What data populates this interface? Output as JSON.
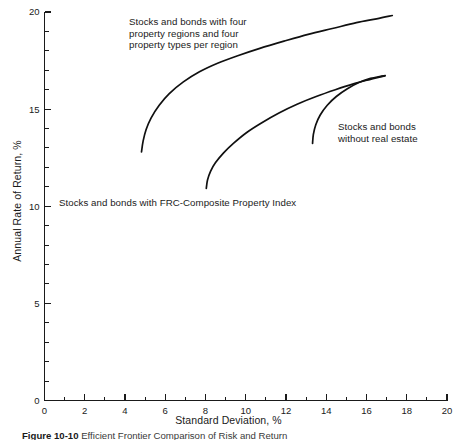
{
  "chart_data": {
    "type": "line",
    "title": "",
    "xlabel": "Standard Deviation, %",
    "ylabel": "Annual Rate of Return, %",
    "xlim": [
      0,
      20
    ],
    "ylim": [
      0,
      20
    ],
    "grid": false,
    "legend_position": "inline-annotations",
    "x_ticks_major": [
      0,
      2,
      4,
      6,
      8,
      10,
      12,
      14,
      16,
      18,
      20
    ],
    "x_ticks_minor": [
      1,
      3,
      5,
      7,
      9,
      11,
      13,
      15,
      17,
      19
    ],
    "y_ticks_major": [
      0,
      5,
      10,
      15,
      20
    ],
    "y_ticks_minor": [
      1,
      2,
      3,
      4,
      6,
      7,
      8,
      9,
      11,
      12,
      13,
      14,
      16,
      17,
      18,
      19
    ],
    "x_tick_labels": [
      "0",
      "2",
      "4",
      "6",
      "8",
      "10",
      "12",
      "14",
      "16",
      "18",
      "20"
    ],
    "y_tick_labels": [
      "0",
      "5",
      "10",
      "15",
      "20"
    ],
    "series": [
      {
        "name": "Stocks and bonds with four property regions and four property types per region",
        "color": "#101010",
        "x": [
          4.82,
          4.9,
          5.05,
          5.3,
          5.7,
          6.2,
          6.9,
          7.7,
          8.6,
          9.6,
          10.7,
          11.9,
          13.1,
          14.3,
          15.5,
          16.5,
          17.28
        ],
        "y": [
          12.8,
          13.35,
          13.95,
          14.55,
          15.2,
          15.8,
          16.4,
          16.92,
          17.36,
          17.75,
          18.13,
          18.5,
          18.85,
          19.15,
          19.45,
          19.65,
          19.82
        ]
      },
      {
        "name": "Stocks and bonds with FRC-Composite Property Index",
        "color": "#101010",
        "x": [
          8.04,
          8.1,
          8.25,
          8.5,
          8.9,
          9.4,
          10.05,
          10.8,
          11.65,
          12.55,
          13.5,
          14.45,
          15.35,
          16.15,
          16.7,
          16.92
        ],
        "y": [
          10.92,
          11.35,
          11.8,
          12.25,
          12.75,
          13.25,
          13.8,
          14.3,
          14.8,
          15.25,
          15.65,
          16.0,
          16.3,
          16.52,
          16.66,
          16.72
        ]
      },
      {
        "name": "Stocks and bonds without real estate",
        "color": "#101010",
        "x": [
          13.32,
          13.36,
          13.48,
          13.7,
          14.05,
          14.5,
          15.05,
          15.65,
          16.2,
          16.65,
          16.92
        ],
        "y": [
          13.24,
          13.7,
          14.2,
          14.7,
          15.2,
          15.65,
          16.05,
          16.38,
          16.58,
          16.68,
          16.72
        ]
      }
    ],
    "annotations": [
      {
        "id": "top-frontier",
        "text": "Stocks and bonds with four\nproperty regions and four\nproperty types per region"
      },
      {
        "id": "right-frontier",
        "text": "Stocks and bonds\nwithout real estate"
      },
      {
        "id": "frc-frontier",
        "text": "Stocks and bonds with FRC-Composite Property Index"
      }
    ]
  },
  "axes": {
    "x_title": "Standard Deviation, %",
    "y_title": "Annual Rate of Return, %"
  },
  "caption": {
    "label": "Figure 10-10",
    "text": "Efficient Frontier Comparison of Risk and Return"
  },
  "colors": {
    "curve": "#101010",
    "axis": "#1a1a1a",
    "text": "#1a1a1a",
    "background": "#ffffff"
  }
}
